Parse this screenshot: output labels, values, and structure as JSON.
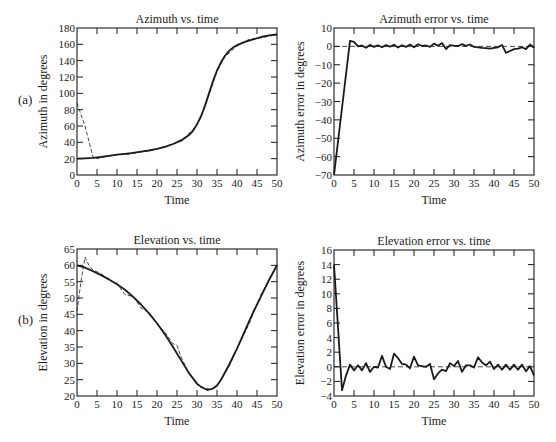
{
  "panels": [
    {
      "label": "(a)",
      "x": 18,
      "y": 100
    },
    {
      "label": "(b)",
      "x": 18,
      "y": 320
    }
  ],
  "colors": {
    "ink": "#1a1a1a",
    "background": "#ffffff"
  },
  "chart_data": [
    {
      "type": "line",
      "id": "azimuth",
      "title": "Azimuth vs. time",
      "xlabel": "Time",
      "ylabel": "Azimuth in degrees",
      "frame": {
        "left": 77,
        "top": 28,
        "right": 277,
        "bottom": 175
      },
      "xlim": [
        0,
        50
      ],
      "ylim": [
        0,
        180
      ],
      "xticks": [
        0,
        5,
        10,
        15,
        20,
        25,
        30,
        35,
        40,
        45,
        50
      ],
      "yticks": [
        0,
        20,
        40,
        60,
        80,
        100,
        120,
        140,
        160,
        180
      ],
      "grid": false,
      "series": [
        {
          "name": "true azimuth",
          "style": "solid",
          "x": [
            0,
            2,
            4,
            6,
            8,
            10,
            12,
            14,
            16,
            18,
            20,
            22,
            24,
            26,
            28,
            29,
            30,
            31,
            32,
            33,
            34,
            35,
            36,
            37,
            38,
            39,
            40,
            42,
            44,
            46,
            48,
            50
          ],
          "y": [
            20,
            20.5,
            21,
            22,
            23.5,
            25,
            26,
            27,
            28.5,
            30,
            32,
            34.5,
            38,
            42,
            49,
            54,
            62,
            72,
            85,
            100,
            115,
            128,
            138,
            146,
            152,
            156,
            159,
            163,
            166,
            169,
            171,
            172
          ]
        },
        {
          "name": "estimated azimuth",
          "style": "dashed",
          "x": [
            0,
            2,
            4,
            5,
            7,
            10,
            13,
            16,
            20,
            24,
            27,
            29,
            31,
            33,
            35,
            37,
            40,
            43,
            45,
            48,
            50
          ],
          "y": [
            88,
            60,
            22,
            20,
            23,
            25,
            25.5,
            28,
            32,
            38,
            46,
            56,
            70,
            98,
            127,
            145,
            158,
            166,
            167,
            170,
            172
          ]
        }
      ]
    },
    {
      "type": "line",
      "id": "azimuth-error",
      "title": "Azimuth error vs. time",
      "xlabel": "Time",
      "ylabel": "Azimuth error in degrees",
      "frame": {
        "left": 334,
        "top": 28,
        "right": 534,
        "bottom": 175
      },
      "xlim": [
        0,
        50
      ],
      "ylim": [
        -70,
        10
      ],
      "xticks": [
        0,
        5,
        10,
        15,
        20,
        25,
        30,
        35,
        40,
        45,
        50
      ],
      "yticks": [
        10,
        0,
        -10,
        -20,
        -30,
        -40,
        -50,
        -60,
        -70
      ],
      "grid": false,
      "zero_line": true,
      "series": [
        {
          "name": "azimuth error",
          "style": "solid",
          "x": [
            0,
            4,
            5,
            6,
            7,
            8,
            9,
            10,
            11,
            12,
            13,
            14,
            15,
            16,
            17,
            18,
            19,
            20,
            21,
            22,
            23,
            24,
            25,
            26,
            27,
            28,
            29,
            30,
            31,
            32,
            33,
            34,
            35,
            36,
            37,
            38,
            39,
            40,
            41,
            42,
            43,
            44,
            45,
            46,
            47,
            48,
            49,
            50
          ],
          "y": [
            -70,
            3,
            2.5,
            0,
            0.5,
            -0.8,
            0.8,
            -0.3,
            0.6,
            -0.5,
            0.7,
            -0.2,
            0.9,
            -0.6,
            0.6,
            -0.3,
            1.0,
            -0.5,
            1.2,
            0.2,
            0.5,
            -0.3,
            1.5,
            0.3,
            1.8,
            -1.5,
            0.7,
            0.4,
            0.2,
            1.2,
            0.3,
            1.0,
            -0.3,
            -0.5,
            -0.8,
            -1.0,
            -1.2,
            -0.8,
            -0.5,
            0.8,
            -3.5,
            -2.5,
            -1.5,
            -1.2,
            -0.5,
            -1.5,
            1.0,
            -0.8
          ]
        }
      ]
    },
    {
      "type": "line",
      "id": "elevation",
      "title": "Elevation vs. time",
      "xlabel": "Time",
      "ylabel": "Elevation in degrees",
      "frame": {
        "left": 77,
        "top": 249,
        "right": 277,
        "bottom": 396
      },
      "xlim": [
        0,
        50
      ],
      "ylim": [
        20,
        65
      ],
      "xticks": [
        0,
        5,
        10,
        15,
        20,
        25,
        30,
        35,
        40,
        45,
        50
      ],
      "yticks": [
        20,
        25,
        30,
        35,
        40,
        45,
        50,
        55,
        60,
        65
      ],
      "grid": false,
      "series": [
        {
          "name": "true elevation",
          "style": "solid",
          "x": [
            0,
            2,
            4,
            6,
            8,
            10,
            12,
            14,
            16,
            18,
            20,
            22,
            24,
            26,
            28,
            30,
            31,
            32,
            33,
            34,
            35,
            36,
            38,
            40,
            42,
            44,
            46,
            48,
            50
          ],
          "y": [
            60,
            59.3,
            58.2,
            57,
            55.7,
            54.2,
            52.5,
            50.4,
            48,
            45.3,
            42.3,
            38.8,
            35,
            31,
            27,
            23.8,
            22.8,
            22.2,
            22,
            22.3,
            23.2,
            25,
            29.5,
            34.5,
            40,
            45.5,
            50.5,
            55.5,
            60
          ]
        },
        {
          "name": "estimated elevation",
          "style": "dashed",
          "x": [
            0,
            1,
            2,
            3,
            4,
            6,
            8,
            10,
            12,
            14,
            16,
            18,
            20,
            22,
            24,
            25,
            26,
            28,
            30,
            32,
            33,
            34,
            35,
            36,
            38,
            40,
            43,
            46,
            48,
            50
          ],
          "y": [
            46,
            55,
            62.5,
            60,
            58.5,
            57.5,
            55.5,
            54.5,
            51,
            50.5,
            47,
            45.5,
            42,
            39.5,
            36,
            35.5,
            32,
            27,
            23.5,
            22,
            21.5,
            22.3,
            23,
            25,
            29,
            34.5,
            42,
            51,
            55.5,
            60
          ]
        }
      ]
    },
    {
      "type": "line",
      "id": "elevation-error",
      "title": "Elevation error vs. time",
      "xlabel": "Time",
      "ylabel": "Elevation error in degrees",
      "frame": {
        "left": 334,
        "top": 250,
        "right": 534,
        "bottom": 396
      },
      "xlim": [
        0,
        50
      ],
      "ylim": [
        -4,
        16
      ],
      "xticks": [
        0,
        5,
        10,
        15,
        20,
        25,
        30,
        35,
        40,
        45,
        50
      ],
      "yticks": [
        16,
        14,
        12,
        10,
        8,
        6,
        4,
        2,
        0,
        -2,
        -4
      ],
      "grid": false,
      "zero_line": true,
      "series": [
        {
          "name": "elevation error",
          "style": "solid",
          "x": [
            0,
            2,
            3,
            4,
            5,
            6,
            7,
            8,
            9,
            10,
            11,
            12,
            13,
            14,
            15,
            16,
            17,
            18,
            19,
            20,
            21,
            22,
            23,
            24,
            25,
            26,
            27,
            28,
            29,
            30,
            31,
            32,
            33,
            34,
            35,
            36,
            37,
            38,
            39,
            40,
            41,
            42,
            43,
            44,
            45,
            46,
            47,
            48,
            49,
            50
          ],
          "y": [
            14,
            -3.2,
            -1.2,
            0.3,
            -0.5,
            0.2,
            -0.5,
            0.5,
            -0.7,
            0,
            -0.1,
            1.5,
            0,
            -0.3,
            1.8,
            1.2,
            0.4,
            0.3,
            -0.2,
            1.4,
            0.2,
            0.1,
            0,
            0.4,
            -1.7,
            -0.9,
            -0.4,
            -0.6,
            0.5,
            0.1,
            0.8,
            -0.7,
            0.2,
            0.2,
            -0.1,
            1.3,
            0.6,
            0.2,
            0.7,
            -0.3,
            0.3,
            -0.4,
            0.3,
            -0.4,
            0.3,
            -0.4,
            0.3,
            -0.6,
            0.1,
            -1.2
          ]
        }
      ]
    }
  ]
}
